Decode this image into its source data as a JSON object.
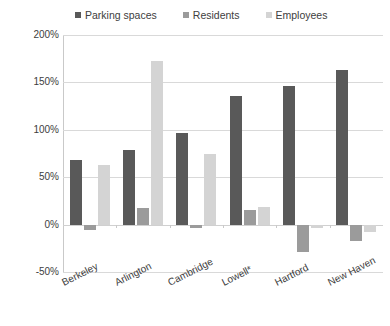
{
  "chart_data": {
    "type": "bar",
    "title": "",
    "subtitle": "",
    "xlabel": "",
    "ylabel": "Percentage change, 1960-2000",
    "categories": [
      "Berkeley",
      "Arlington",
      "Cambridge",
      "Lowell*",
      "Hartford",
      "New Haven"
    ],
    "series": [
      {
        "name": "Parking spaces",
        "color": "#595959",
        "values": [
          68,
          79,
          97,
          136,
          146,
          163
        ]
      },
      {
        "name": "Residents",
        "color": "#9b9b9b",
        "values": [
          -6,
          17,
          -4,
          15,
          -29,
          -17
        ]
      },
      {
        "name": "Employees",
        "color": "#d4d4d4",
        "values": [
          63,
          173,
          75,
          19,
          -4,
          -8
        ]
      }
    ],
    "ylim": [
      -50,
      200
    ],
    "ytick_values": [
      200,
      150,
      100,
      50,
      0,
      -50
    ],
    "ytick_labels": [
      "200%",
      "150%",
      "100%",
      "50%",
      "0%",
      "-50%"
    ],
    "ytick_suffix": "%",
    "grid": true,
    "grid_axis": "y",
    "legend_position": "top",
    "legend_entries": [
      "Parking spaces",
      "Residents",
      "Employees"
    ],
    "annotations": []
  }
}
